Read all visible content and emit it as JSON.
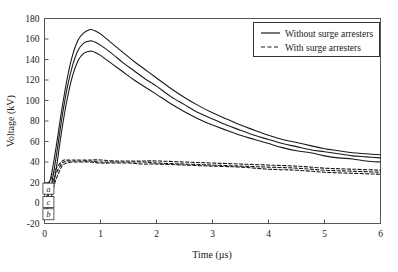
{
  "chart_data": {
    "type": "line",
    "title": "",
    "xlabel": "Time (µs)",
    "ylabel": "Voltage (kV)",
    "xlim": [
      0,
      6
    ],
    "ylim": [
      -20,
      180
    ],
    "xticks": [
      0,
      1,
      2,
      3,
      4,
      5,
      6
    ],
    "yticks": [
      -20,
      0,
      20,
      40,
      60,
      80,
      100,
      120,
      140,
      160,
      180
    ],
    "xtick_labels": [
      "0",
      "1",
      "2",
      "3",
      "4",
      "5",
      "6"
    ],
    "ytick_labels": [
      "-20",
      "0",
      "20",
      "40",
      "60",
      "80",
      "100",
      "120",
      "140",
      "160",
      "180"
    ],
    "grid": false,
    "legend_position": "top-right",
    "legend": [
      {
        "label": "Without surge arresters",
        "style": "solid",
        "color": "#1a1a1a"
      },
      {
        "label": "With surge arresters",
        "style": "dashed",
        "color": "#1a1a1a"
      }
    ],
    "annotations": [
      {
        "text": "a",
        "x": 0.07,
        "y": 14,
        "boxed": true
      },
      {
        "text": "c",
        "x": 0.07,
        "y": 1,
        "boxed": true
      },
      {
        "text": "b",
        "x": 0.07,
        "y": -11,
        "boxed": true
      }
    ],
    "series": [
      {
        "name": "a - without surge arresters",
        "style": "solid",
        "color": "#1a1a1a",
        "x": [
          0.0,
          0.1,
          0.2,
          0.3,
          0.4,
          0.5,
          0.6,
          0.7,
          0.8,
          0.85,
          0.9,
          1.0,
          1.2,
          1.4,
          1.6,
          1.8,
          2.0,
          2.25,
          2.5,
          2.75,
          3.0,
          3.25,
          3.5,
          3.75,
          4.0,
          4.25,
          4.5,
          4.75,
          5.0,
          5.25,
          5.5,
          5.75,
          6.0
        ],
        "y": [
          14,
          22,
          52,
          88,
          120,
          144,
          159,
          166,
          169,
          169,
          168,
          165,
          156,
          147,
          138,
          130,
          122,
          112,
          103,
          95,
          88,
          82,
          76,
          71,
          66,
          62,
          59,
          56,
          53,
          51,
          49,
          48,
          47
        ]
      },
      {
        "name": "c - without surge arresters",
        "style": "solid",
        "color": "#1a1a1a",
        "x": [
          0.0,
          0.1,
          0.2,
          0.3,
          0.4,
          0.5,
          0.6,
          0.7,
          0.8,
          0.85,
          0.9,
          1.0,
          1.2,
          1.4,
          1.6,
          1.8,
          2.0,
          2.25,
          2.5,
          2.75,
          3.0,
          3.25,
          3.5,
          3.75,
          4.0,
          4.25,
          4.5,
          4.75,
          5.0,
          5.25,
          5.5,
          5.75,
          6.0
        ],
        "y": [
          1,
          12,
          42,
          79,
          111,
          134,
          149,
          156,
          158,
          158,
          157,
          154,
          146,
          137,
          129,
          121,
          114,
          104,
          96,
          88,
          82,
          76,
          71,
          66,
          62,
          58,
          55,
          52,
          50,
          48,
          46,
          45,
          44
        ]
      },
      {
        "name": "b - without surge arresters",
        "style": "solid",
        "color": "#1a1a1a",
        "x": [
          0.0,
          0.1,
          0.2,
          0.3,
          0.4,
          0.5,
          0.6,
          0.7,
          0.8,
          0.85,
          0.9,
          1.0,
          1.2,
          1.4,
          1.6,
          1.8,
          2.0,
          2.25,
          2.5,
          2.75,
          3.0,
          3.25,
          3.5,
          3.75,
          4.0,
          4.25,
          4.5,
          4.75,
          5.0,
          5.25,
          5.5,
          5.75,
          6.0
        ],
        "y": [
          -11,
          0,
          30,
          68,
          100,
          124,
          139,
          146,
          148,
          148,
          147,
          144,
          136,
          128,
          120,
          113,
          106,
          97,
          89,
          82,
          76,
          71,
          66,
          62,
          58,
          54,
          51,
          49,
          46,
          44,
          43,
          41,
          40
        ]
      },
      {
        "name": "a - with surge arresters",
        "style": "dashed",
        "color": "#1a1a1a",
        "x": [
          0.0,
          0.1,
          0.2,
          0.3,
          0.35,
          0.4,
          0.5,
          0.6,
          0.8,
          1.0,
          1.25,
          1.5,
          1.75,
          2.0,
          2.5,
          3.0,
          3.5,
          4.0,
          4.5,
          5.0,
          5.5,
          6.0
        ],
        "y": [
          14,
          22,
          33,
          40,
          42,
          42,
          42,
          42,
          42,
          42,
          41,
          41,
          41,
          41,
          40,
          39,
          38,
          37,
          36,
          34,
          33,
          32
        ]
      },
      {
        "name": "c - with surge arresters",
        "style": "dashed",
        "color": "#1a1a1a",
        "x": [
          0.0,
          0.1,
          0.2,
          0.3,
          0.35,
          0.4,
          0.5,
          0.6,
          0.8,
          1.0,
          1.25,
          1.5,
          1.75,
          2.0,
          2.5,
          3.0,
          3.5,
          4.0,
          4.5,
          5.0,
          5.5,
          6.0
        ],
        "y": [
          1,
          14,
          28,
          38,
          40,
          41,
          41,
          41,
          41,
          40,
          40,
          40,
          40,
          39,
          38,
          37,
          36,
          35,
          34,
          32,
          31,
          30
        ]
      },
      {
        "name": "b - with surge arresters",
        "style": "dashed",
        "color": "#1a1a1a",
        "x": [
          0.0,
          0.1,
          0.2,
          0.3,
          0.35,
          0.4,
          0.5,
          0.6,
          0.8,
          1.0,
          1.25,
          1.5,
          1.75,
          2.0,
          2.5,
          3.0,
          3.5,
          4.0,
          4.5,
          5.0,
          5.5,
          6.0
        ],
        "y": [
          -11,
          4,
          22,
          35,
          38,
          39,
          40,
          40,
          40,
          39,
          39,
          39,
          38,
          38,
          37,
          36,
          35,
          33,
          32,
          30,
          29,
          28
        ]
      }
    ]
  },
  "style": {
    "axis_color": "#555555",
    "curve_color": "#1a1a1a",
    "background": "#ffffff",
    "legend_border": "#333333"
  }
}
